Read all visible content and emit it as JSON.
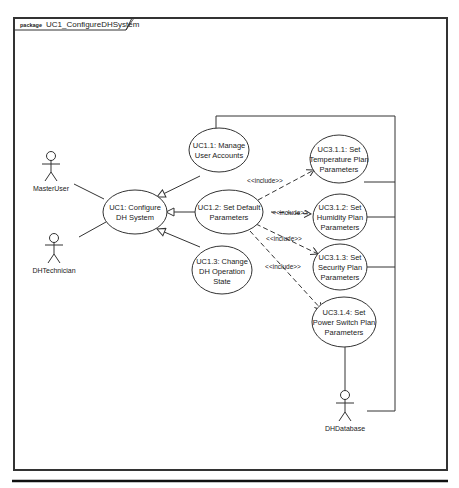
{
  "package": {
    "keyword": "package",
    "name": "UC1_ConfigureDHSystem"
  },
  "actors": [
    {
      "id": "master-user",
      "label": "MasterUser"
    },
    {
      "id": "dh-technician",
      "label": "DHTechnician"
    },
    {
      "id": "dh-database",
      "label": "DHDatabase"
    }
  ],
  "use_cases": {
    "uc1": {
      "line1": "UC1: Configure",
      "line2": "DH System"
    },
    "uc1_1": {
      "line1": "UC1.1: Manage",
      "line2": "User Accounts"
    },
    "uc1_2": {
      "line1": "UC1.2: Set Default",
      "line2": "Parameters"
    },
    "uc1_3": {
      "line1": "UC1.3: Change",
      "line2": "DH Operation",
      "line3": "State"
    },
    "uc3_1_1": {
      "line1": "UC3.1.1: Set",
      "line2": "Temperature Plan",
      "line3": "Parameters"
    },
    "uc3_1_2": {
      "line1": "UC3.1.2: Set",
      "line2": "Humidity Plan",
      "line3": "Parameters"
    },
    "uc3_1_3": {
      "line1": "UC3.1.3: Set",
      "line2": "Security Plan",
      "line3": "Parameters"
    },
    "uc3_1_4": {
      "line1": "UC3.1.4: Set",
      "line2": "Power Switch Plan",
      "line3": "Parameters"
    }
  },
  "relationships": {
    "include_label": "<<include>>",
    "include": [
      {
        "from": "uc1_2",
        "to": "uc3_1_1",
        "label": "<<include>>"
      },
      {
        "from": "uc1_2",
        "to": "uc3_1_2",
        "label": "<<include>>"
      },
      {
        "from": "uc1_2",
        "to": "uc3_1_3",
        "label": "<<include>>"
      },
      {
        "from": "uc1_2",
        "to": "uc3_1_4",
        "label": "<<include>>"
      }
    ],
    "generalization": [
      {
        "from": "uc1_1",
        "to": "uc1"
      },
      {
        "from": "uc1_2",
        "to": "uc1"
      },
      {
        "from": "uc1_3",
        "to": "uc1"
      }
    ],
    "association": [
      {
        "from": "master-user",
        "to": "uc1"
      },
      {
        "from": "dh-technician",
        "to": "uc1"
      },
      {
        "from": "dh-database",
        "to": "uc1_1"
      },
      {
        "from": "dh-database",
        "to": "uc3_1_1"
      },
      {
        "from": "dh-database",
        "to": "uc3_1_2"
      },
      {
        "from": "dh-database",
        "to": "uc3_1_3"
      },
      {
        "from": "dh-database",
        "to": "uc3_1_4"
      }
    ]
  },
  "colors": {
    "line": "#333333",
    "frame": "#333333",
    "background": "#ffffff"
  }
}
